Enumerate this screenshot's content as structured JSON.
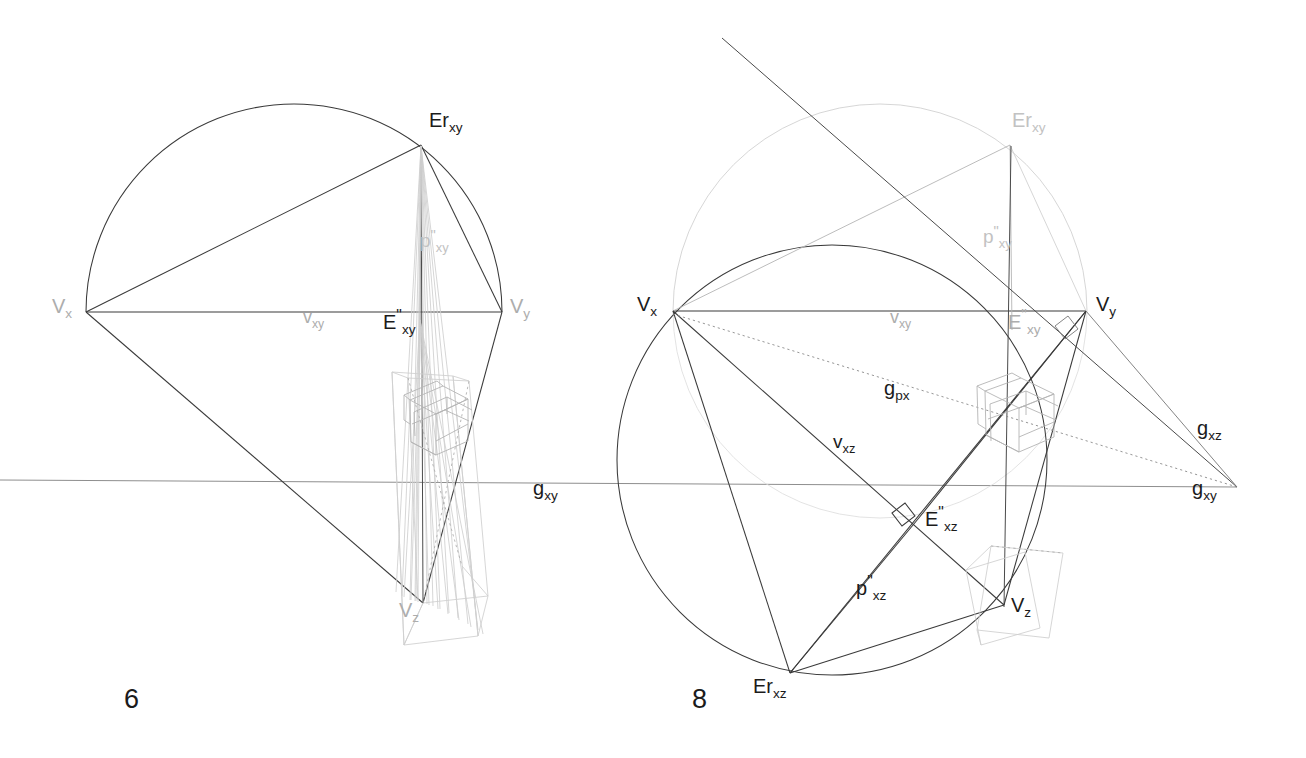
{
  "document": {
    "type": "technical-drawing",
    "subject": "Three-point perspective vanishing-point construction, two plates",
    "background_color": "#ffffff",
    "ink_dark": "#1b1b1b",
    "ink_mid": "#6f6f6f",
    "ink_faint": "#adadad",
    "ink_vfaint": "#c8c8c8"
  },
  "figures": [
    {
      "number": "6",
      "number_pos": {
        "x": 124,
        "y": 686
      },
      "labels": [
        {
          "id": "vx",
          "base": "V",
          "sub": "x",
          "prime": "",
          "x": 52,
          "y": 296,
          "size": 20,
          "tone": "faint"
        },
        {
          "id": "vy",
          "base": "V",
          "sub": "y",
          "prime": "",
          "x": 510,
          "y": 296,
          "size": 20,
          "tone": "faint"
        },
        {
          "id": "erxy",
          "base": "Er",
          "sub": "xy",
          "prime": "",
          "x": 429,
          "y": 110,
          "size": 20,
          "tone": "dark"
        },
        {
          "id": "exy",
          "base": "E",
          "sub": "xy",
          "prime": "\"",
          "x": 383,
          "y": 308,
          "size": 20,
          "tone": "dark"
        },
        {
          "id": "pxy",
          "base": "p",
          "sub": "xy",
          "prime": "\"",
          "x": 420,
          "y": 228,
          "size": 19,
          "tone": "vfaint"
        },
        {
          "id": "vxy",
          "base": "v",
          "sub": "xy",
          "prime": "",
          "x": 303,
          "y": 308,
          "size": 18,
          "tone": "faint"
        },
        {
          "id": "vz",
          "base": "V",
          "sub": "z",
          "prime": "",
          "x": 399,
          "y": 600,
          "size": 20,
          "tone": "faint"
        },
        {
          "id": "gxy",
          "base": "g",
          "sub": "xy",
          "prime": "",
          "x": 533,
          "y": 478,
          "size": 20,
          "tone": "dark"
        }
      ]
    },
    {
      "number": "8",
      "number_pos": {
        "x": 692,
        "y": 686
      },
      "labels": [
        {
          "id": "vx8",
          "base": "V",
          "sub": "x",
          "prime": "",
          "x": 637,
          "y": 294,
          "size": 21,
          "tone": "dark"
        },
        {
          "id": "vy8",
          "base": "V",
          "sub": "y",
          "prime": "",
          "x": 1096,
          "y": 294,
          "size": 21,
          "tone": "dark"
        },
        {
          "id": "erxy8",
          "base": "Er",
          "sub": "xy",
          "prime": "",
          "x": 1012,
          "y": 110,
          "size": 20,
          "tone": "vfaint"
        },
        {
          "id": "exy8",
          "base": "E",
          "sub": "xy",
          "prime": "\"",
          "x": 1008,
          "y": 308,
          "size": 20,
          "tone": "faint"
        },
        {
          "id": "pxy8",
          "base": "p",
          "sub": "xy",
          "prime": "\"",
          "x": 983,
          "y": 224,
          "size": 19,
          "tone": "vfaint"
        },
        {
          "id": "vxy8",
          "base": "v",
          "sub": "xy",
          "prime": "",
          "x": 890,
          "y": 308,
          "size": 18,
          "tone": "faint"
        },
        {
          "id": "gpx8",
          "base": "g",
          "sub": "px",
          "prime": "",
          "x": 884,
          "y": 378,
          "size": 20,
          "tone": "dark"
        },
        {
          "id": "vxz8",
          "base": "v",
          "sub": "xz",
          "prime": "",
          "x": 833,
          "y": 432,
          "size": 19,
          "tone": "dark"
        },
        {
          "id": "exz8",
          "base": "E",
          "sub": "xz",
          "prime": "\"",
          "x": 925,
          "y": 505,
          "size": 20,
          "tone": "dark"
        },
        {
          "id": "pxz8",
          "base": "p",
          "sub": "xz",
          "prime": "\"",
          "x": 856,
          "y": 574,
          "size": 20,
          "tone": "dark"
        },
        {
          "id": "vz8",
          "base": "V",
          "sub": "z",
          "prime": "",
          "x": 1011,
          "y": 595,
          "size": 21,
          "tone": "dark"
        },
        {
          "id": "erxz8",
          "base": "Er",
          "sub": "xz",
          "prime": "",
          "x": 753,
          "y": 676,
          "size": 20,
          "tone": "dark"
        },
        {
          "id": "gxz8",
          "base": "g",
          "sub": "xz",
          "prime": "",
          "x": 1197,
          "y": 418,
          "size": 20,
          "tone": "dark"
        },
        {
          "id": "gxy8",
          "base": "g",
          "sub": "xy",
          "prime": "",
          "x": 1192,
          "y": 478,
          "size": 20,
          "tone": "dark"
        }
      ]
    }
  ],
  "geometry": {
    "horizon_y": 480,
    "left": {
      "Vx": [
        86,
        312
      ],
      "Vy": [
        502,
        312
      ],
      "Erxy": [
        421,
        145
      ],
      "Exy": [
        420,
        312
      ],
      "Vz": [
        423,
        603
      ],
      "circle_center": [
        294,
        312
      ],
      "circle_r": 208
    },
    "right": {
      "Vx": [
        673,
        311
      ],
      "Vy": [
        1086,
        311
      ],
      "Erxy": [
        1010,
        145
      ],
      "Exy": [
        1013,
        311
      ],
      "Vz": [
        1004,
        605
      ],
      "Erxz": [
        790,
        673
      ],
      "Exz": [
        918,
        519
      ],
      "circle_xy_center": [
        880,
        311
      ],
      "circle_xy_r": 207,
      "circle_xz_center": [
        832,
        460
      ],
      "circle_xz_r": 215,
      "gxy_vanish": [
        1237,
        487
      ]
    }
  }
}
